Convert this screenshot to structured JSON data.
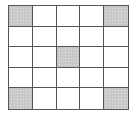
{
  "diagram": {
    "type": "grid",
    "rows": 5,
    "columns": 5,
    "shaded_cells": [
      {
        "row": 1,
        "col": 1
      },
      {
        "row": 1,
        "col": 5
      },
      {
        "row": 3,
        "col": 3
      },
      {
        "row": 5,
        "col": 1
      },
      {
        "row": 5,
        "col": 5
      }
    ],
    "colors": {
      "line": "#555555",
      "shaded": "#c8c8c8",
      "empty": "#ffffff"
    }
  }
}
